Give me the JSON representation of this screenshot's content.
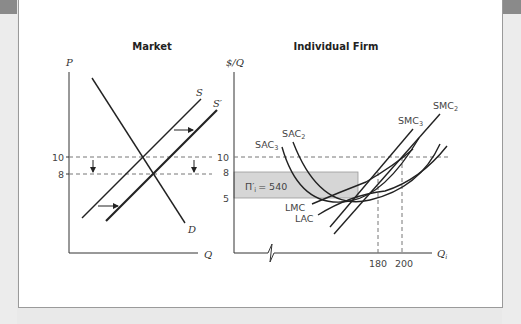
{
  "market": {
    "title": "Market",
    "y_axis_label": "P",
    "x_axis_label": "Q",
    "y_ticks": [
      "10",
      "8"
    ],
    "curves": {
      "supply": "S",
      "supply_shifted": "S′",
      "demand": "D"
    }
  },
  "firm": {
    "title": "Individual Firm",
    "y_axis_label": "$/Q",
    "x_axis_label": "Q",
    "x_axis_sub": "i",
    "y_ticks": [
      "10",
      "8",
      "5"
    ],
    "x_ticks": [
      "180",
      "200"
    ],
    "profit_label": "Π′",
    "profit_sub": "i",
    "profit_value": "= 540",
    "curves": {
      "sac3": "SAC",
      "sac3_sub": "3",
      "sac2": "SAC",
      "sac2_sub": "2",
      "smc3": "SMC",
      "smc3_sub": "3",
      "smc2": "SMC",
      "smc2_sub": "2",
      "lmc": "LMC",
      "lac": "LAC"
    }
  },
  "colors": {
    "shaded_area": "#d6d6d6",
    "curve": "#222222",
    "dashed": "#777777"
  }
}
